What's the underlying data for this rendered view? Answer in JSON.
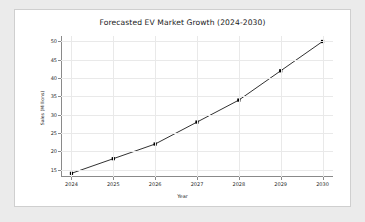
{
  "chart_data": {
    "type": "line",
    "title": "Forecasted EV Market Growth (2024-2030)",
    "xlabel": "Year",
    "ylabel": "Sales (Millions)",
    "categories": [
      "2024",
      "2025",
      "2026",
      "2027",
      "2028",
      "2029",
      "2030"
    ],
    "x": [
      2024,
      2025,
      2026,
      2027,
      2028,
      2029,
      2030
    ],
    "values": [
      14,
      18,
      22,
      28,
      34,
      42,
      50
    ],
    "series": [
      {
        "name": "Sales (Millions)",
        "values": [
          14,
          18,
          22,
          28,
          34,
          42,
          50
        ]
      }
    ],
    "ylim": [
      13,
      51.5
    ],
    "xlim": [
      2023.75,
      2030.25
    ],
    "yticks": [
      15,
      20,
      25,
      30,
      35,
      40,
      45,
      50
    ],
    "ytick_labels": [
      "15",
      "20",
      "25",
      "30",
      "35",
      "40",
      "45",
      "50"
    ],
    "xticks": [
      2024,
      2025,
      2026,
      2027,
      2028,
      2029,
      2030
    ],
    "xtick_labels": [
      "2024",
      "2025",
      "2026",
      "2027",
      "2028",
      "2029",
      "2030"
    ],
    "grid": true,
    "legend": "none",
    "line_color": "#1a1a1a",
    "marker": "square",
    "marker_color": "#000000",
    "grid_color": "#e9e9e9",
    "axis_color": "#8a8a8a",
    "background_color": "#ffffff",
    "page_background_color": "#ebebeb"
  }
}
